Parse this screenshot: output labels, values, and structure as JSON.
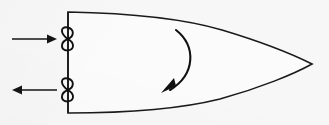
{
  "figure": {
    "title": "Twin-screw vessel turning diagram (plan view)",
    "background_color": "#f7f7f7",
    "ink_color": "#111111",
    "hull_fill": "#fbfbfb"
  },
  "hull": {
    "name": "vessel-hull",
    "label": "",
    "bow_tip": {
      "x": 312,
      "y": 64
    },
    "transom": {
      "x": 68,
      "y_top": 12,
      "y_bottom": 113
    },
    "outline_path": "M 68 12 C 120 13, 178 17, 222 30 C 262 42, 294 55, 312 64 C 294 74, 260 88, 220 99 C 176 110, 120 113, 68 113 Z",
    "transom_path": "M 68 12 L 68 113"
  },
  "propellers": [
    {
      "name": "propeller-upper",
      "label": "",
      "position": {
        "x": 68,
        "y": 39
      },
      "symbol": "figure-eight",
      "upper_lobe_path": "M 68 39 C 60 34, 60 26, 67.5 27.5 C 74.5 29, 74.5 36, 68 39 Z",
      "lower_lobe_path": "M 68 39 C 60 42, 60 50, 67.5 50.5 C 74.5 50, 75 43, 68 39 Z"
    },
    {
      "name": "propeller-lower",
      "label": "",
      "position": {
        "x": 68,
        "y": 90
      },
      "symbol": "figure-eight",
      "upper_lobe_path": "M 68 90 C 60 85, 60 77, 67.5 78.5 C 74.5 80, 74.5 87, 68 90 Z",
      "lower_lobe_path": "M 68 90 C 60 93, 60 101, 67.5 101.5 C 74.5 101, 75 94, 68 90 Z"
    }
  ],
  "thrust_arrows": [
    {
      "name": "thrust-arrow-ahead",
      "label": "",
      "direction": "right",
      "meaning": "ahead-thrust",
      "shaft": {
        "x1": 12,
        "y1": 39,
        "x2": 53,
        "y2": 39
      },
      "head_points": "57,39 47,34.5 47,43.5"
    },
    {
      "name": "thrust-arrow-astern",
      "label": "",
      "direction": "left",
      "meaning": "astern-thrust",
      "shaft": {
        "x1": 57,
        "y1": 90,
        "x2": 17,
        "y2": 90
      },
      "head_points": "12,90 22,85.5 22,94.5"
    }
  ],
  "rotation_arrow": {
    "name": "turning-moment-arrow",
    "label": "",
    "meaning": "resulting-turning-moment",
    "direction": "clockwise",
    "arc_path": "M 176 30 C 196 46, 196 74, 170 90",
    "head_points": "161,93 176,86 174,78"
  },
  "colors": {
    "ink": "#111111",
    "hull_stroke": "#1a1a1a",
    "background": "#f7f7f7"
  }
}
